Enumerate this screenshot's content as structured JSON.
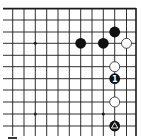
{
  "diagram": {
    "type": "go-board",
    "view": "top-right corner fragment",
    "colors": {
      "background": "#ffffff",
      "line": "#1a1a1a",
      "black_stone": "#111111",
      "white_stone": "#ffffff",
      "white_stone_border": "#222222",
      "label_on_black": "#ffffff"
    },
    "grid": {
      "cols_x": [
        12.7,
        24,
        35.3,
        46.7,
        58,
        69.3,
        80.7,
        92,
        103.3,
        114.7,
        126.5
      ],
      "rows_y": [
        8.7,
        20,
        32,
        43.3,
        55.3,
        66.7,
        78.7,
        90,
        102,
        114,
        126
      ],
      "right_edge_x": 136,
      "top_edge_y": 8.7,
      "left_extend_x": 3,
      "bottom_extend_y": 136
    },
    "star_points": [
      {
        "col": 2,
        "row": 3
      },
      {
        "col": 2,
        "row": 9
      },
      {
        "col": 8,
        "row": 9
      }
    ],
    "stones": [
      {
        "color": "black",
        "col": 9,
        "row": 2,
        "label": ""
      },
      {
        "color": "black",
        "col": 6,
        "row": 3,
        "label": ""
      },
      {
        "color": "black",
        "col": 8,
        "row": 3,
        "label": ""
      },
      {
        "color": "white",
        "col": 10,
        "row": 3,
        "label": ""
      },
      {
        "color": "white",
        "col": 9,
        "row": 5,
        "label": ""
      },
      {
        "color": "black",
        "col": 9,
        "row": 6,
        "label": "1"
      },
      {
        "color": "white",
        "col": 9,
        "row": 8,
        "label": ""
      },
      {
        "color": "black",
        "col": 9,
        "row": 10,
        "label": "",
        "marker": "triangle"
      }
    ],
    "stone_radius": 5.4
  }
}
